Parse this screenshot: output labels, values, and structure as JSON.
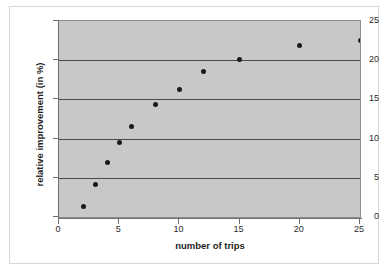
{
  "chart_data": {
    "type": "scatter",
    "title": "",
    "xlabel": "number of trips",
    "ylabel": "relative improvement  (in %)",
    "xlim": [
      0,
      25
    ],
    "ylim": [
      0,
      25
    ],
    "xticks": [
      0,
      5,
      10,
      15,
      20,
      25
    ],
    "yticks": [
      0,
      5,
      10,
      15,
      20,
      25
    ],
    "xtick_labels": [
      "0",
      "5",
      "10",
      "15",
      "20",
      "25"
    ],
    "ytick_labels": [
      "0",
      "5",
      "10",
      "15",
      "20",
      "25"
    ],
    "grid": "horizontal",
    "legend": "none",
    "plot_background": "#c8c8c8",
    "marker_color": "#1a1a1a",
    "gridline_color": "#4a4a4a",
    "x": [
      2,
      3,
      4,
      5,
      6,
      8,
      10,
      12,
      15,
      20,
      25
    ],
    "values": [
      1.3,
      4.2,
      6.9,
      9.5,
      11.6,
      14.3,
      16.3,
      18.5,
      20.1,
      21.9,
      22.5
    ],
    "series": [
      {
        "name": "relative improvement",
        "points": [
          {
            "x": 2,
            "y": 1.3
          },
          {
            "x": 3,
            "y": 4.2
          },
          {
            "x": 4,
            "y": 6.9
          },
          {
            "x": 5,
            "y": 9.5
          },
          {
            "x": 6,
            "y": 11.6
          },
          {
            "x": 8,
            "y": 14.3
          },
          {
            "x": 10,
            "y": 16.3
          },
          {
            "x": 12,
            "y": 18.5
          },
          {
            "x": 15,
            "y": 20.1
          },
          {
            "x": 20,
            "y": 21.9
          },
          {
            "x": 25,
            "y": 22.5
          }
        ]
      }
    ]
  }
}
